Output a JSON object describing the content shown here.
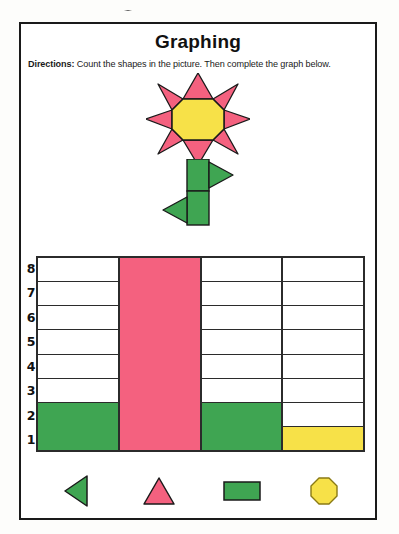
{
  "worksheet": {
    "title": "Graphing",
    "directions_lead": "Directions:",
    "directions_text": " Count the shapes in the picture. Then complete the graph below."
  },
  "colors": {
    "pink": "#f4617f",
    "green": "#3fa552",
    "yellow": "#f7e148",
    "outline": "#1a1a1a",
    "grid_line": "#2b2b2b",
    "paper": "#ffffff"
  },
  "illustration": {
    "name": "flower-picture",
    "petals": {
      "shape": "triangle",
      "count": 8,
      "color": "#f4617f"
    },
    "center": {
      "shape": "octagon",
      "count": 1,
      "color": "#f7e148"
    },
    "stem": {
      "shape": "rectangle",
      "count": 2,
      "color": "#3fa552"
    },
    "leaves": {
      "shape": "triangle",
      "count": 2,
      "color": "#3fa552"
    }
  },
  "chart_data": {
    "type": "bar",
    "title": "Graphing",
    "categories": [
      "green-triangle",
      "pink-triangle",
      "green-rectangle",
      "yellow-octagon"
    ],
    "values": [
      2,
      8,
      2,
      1
    ],
    "bar_colors": [
      "#3fa552",
      "#f4617f",
      "#3fa552",
      "#f7e148"
    ],
    "xlabel": "",
    "ylabel": "",
    "ylim": [
      0,
      8
    ],
    "y_ticks": [
      "8",
      "7",
      "6",
      "5",
      "4",
      "3",
      "2",
      "1"
    ],
    "grid": true,
    "legend_position": "bottom"
  },
  "legend": {
    "items": [
      {
        "icon": "triangle-left-icon",
        "color": "#3fa552"
      },
      {
        "icon": "triangle-up-icon",
        "color": "#f4617f"
      },
      {
        "icon": "rectangle-icon",
        "color": "#3fa552"
      },
      {
        "icon": "octagon-icon",
        "color": "#f7e148"
      }
    ]
  }
}
